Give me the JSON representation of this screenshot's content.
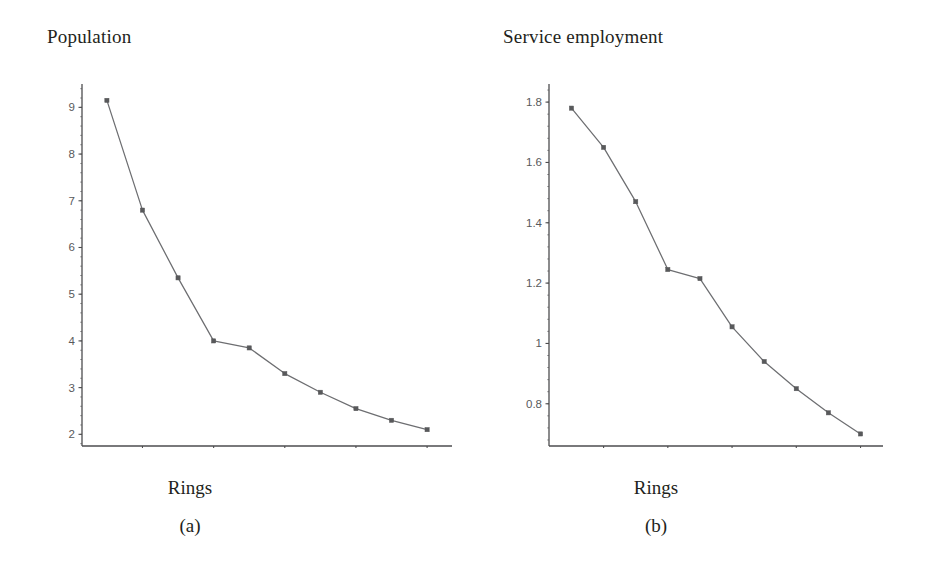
{
  "figure": {
    "background_color": "#ffffff",
    "line_color": "#6d6e71",
    "axis_color": "#4d4d4f",
    "marker_color": "#58595b",
    "text_color": "#231f20"
  },
  "panels": [
    {
      "id": "panel-a",
      "title": "Population",
      "xlabel": "Rings",
      "caption": "(a)"
    },
    {
      "id": "panel-b",
      "title": "Service employment",
      "xlabel": "Rings",
      "caption": "(b)"
    }
  ],
  "chart_data": [
    {
      "type": "line",
      "title": "Population",
      "xlabel": "Rings",
      "ylabel": "",
      "caption": "(a)",
      "x": [
        1,
        2,
        3,
        4,
        5,
        6,
        7,
        8,
        9,
        10
      ],
      "values": [
        9.15,
        6.8,
        5.35,
        4.0,
        3.85,
        3.3,
        2.9,
        2.55,
        2.3,
        2.1
      ],
      "xlim": [
        0.3,
        10.7
      ],
      "ylim": [
        1.75,
        9.5
      ],
      "xticks": [
        2,
        4,
        6,
        8,
        10
      ],
      "xticklabels": [
        "2",
        "4",
        "6",
        "8",
        "10"
      ],
      "yticks": [
        2,
        3,
        4,
        5,
        6,
        7,
        8,
        9
      ],
      "yticklabels": [
        "2",
        "3",
        "4",
        "5",
        "6",
        "7",
        "8",
        "9"
      ],
      "grid": false,
      "legend": null,
      "markers": "square"
    },
    {
      "type": "line",
      "title": "Service employment",
      "xlabel": "Rings",
      "ylabel": "",
      "caption": "(b)",
      "x": [
        1,
        2,
        3,
        4,
        5,
        6,
        7,
        8,
        9,
        10
      ],
      "values": [
        1.78,
        1.65,
        1.47,
        1.245,
        1.215,
        1.055,
        0.94,
        0.85,
        0.77,
        0.7
      ],
      "xlim": [
        0.3,
        10.7
      ],
      "ylim": [
        0.66,
        1.86
      ],
      "xticks": [
        2,
        4,
        6,
        8,
        10
      ],
      "xticklabels": [
        "2",
        "4",
        "6",
        "8",
        "10"
      ],
      "yticks": [
        0.8,
        1.0,
        1.2,
        1.4,
        1.6,
        1.8
      ],
      "yticklabels": [
        "0.8",
        "1",
        "1.2",
        "1.4",
        "1.6",
        "1.8"
      ],
      "grid": false,
      "legend": null,
      "markers": "square"
    }
  ]
}
